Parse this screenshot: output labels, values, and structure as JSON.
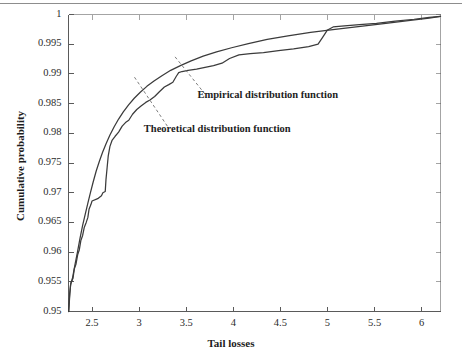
{
  "chart_data": {
    "type": "line",
    "title": "",
    "xlabel": "Tail losses",
    "ylabel": "Cumulative probability",
    "xlim": [
      2.25,
      6.2
    ],
    "ylim": [
      0.95,
      1.0
    ],
    "grid": false,
    "legend_position": "inline-annotations",
    "xticks": [
      "2.5",
      "3",
      "3.5",
      "4",
      "4.5",
      "5",
      "5.5",
      "6"
    ],
    "xtick_values": [
      2.5,
      3,
      3.5,
      4,
      4.5,
      5,
      5.5,
      6
    ],
    "yticks": [
      "0.95",
      "0.955",
      "0.96",
      "0.965",
      "0.97",
      "0.975",
      "0.98",
      "0.985",
      "0.99",
      "0.995",
      "1"
    ],
    "ytick_values": [
      0.95,
      0.955,
      0.96,
      0.965,
      0.97,
      0.975,
      0.98,
      0.985,
      0.99,
      0.995,
      1.0
    ],
    "annotations": [
      {
        "name": "empirical-label",
        "text": "Empirical distribution function",
        "x": 3.62,
        "y": 0.9862
      },
      {
        "name": "theoretical-label",
        "text": "Theoretical distribution function",
        "x": 3.05,
        "y": 0.9805
      }
    ],
    "series": [
      {
        "name": "Theoretical distribution function",
        "color": "#3b3b3b",
        "points": [
          [
            2.252,
            0.95
          ],
          [
            2.262,
            0.9524
          ],
          [
            2.272,
            0.9545
          ],
          [
            2.292,
            0.9556
          ],
          [
            2.318,
            0.9578
          ],
          [
            2.345,
            0.96
          ],
          [
            2.372,
            0.9623
          ],
          [
            2.4,
            0.9645
          ],
          [
            2.428,
            0.9664
          ],
          [
            2.455,
            0.9682
          ],
          [
            2.483,
            0.97
          ],
          [
            2.512,
            0.9718
          ],
          [
            2.545,
            0.9737
          ],
          [
            2.578,
            0.9753
          ],
          [
            2.612,
            0.9768
          ],
          [
            2.65,
            0.9783
          ],
          [
            2.69,
            0.9797
          ],
          [
            2.735,
            0.9811
          ],
          [
            2.782,
            0.9824
          ],
          [
            2.832,
            0.9836
          ],
          [
            2.888,
            0.9848
          ],
          [
            2.948,
            0.9859
          ],
          [
            3.012,
            0.9869
          ],
          [
            3.082,
            0.9879
          ],
          [
            3.158,
            0.9888
          ],
          [
            3.242,
            0.9897
          ],
          [
            3.335,
            0.9906
          ],
          [
            3.438,
            0.9914
          ],
          [
            3.552,
            0.9922
          ],
          [
            3.68,
            0.993
          ],
          [
            3.822,
            0.9937
          ],
          [
            3.982,
            0.9944
          ],
          [
            4.16,
            0.9951
          ],
          [
            4.36,
            0.9958
          ],
          [
            4.58,
            0.9964
          ],
          [
            4.82,
            0.997
          ],
          [
            5.08,
            0.9975
          ],
          [
            5.35,
            0.998
          ],
          [
            5.62,
            0.9985
          ],
          [
            5.88,
            0.999
          ],
          [
            6.08,
            0.9994
          ],
          [
            6.2,
            0.9997
          ]
        ]
      },
      {
        "name": "Empirical distribution function",
        "color": "#3b3b3b",
        "points": [
          [
            2.252,
            0.95
          ],
          [
            2.262,
            0.953
          ],
          [
            2.275,
            0.9548
          ],
          [
            2.298,
            0.9556
          ],
          [
            2.312,
            0.9572
          ],
          [
            2.33,
            0.958
          ],
          [
            2.348,
            0.9596
          ],
          [
            2.365,
            0.9604
          ],
          [
            2.382,
            0.962
          ],
          [
            2.4,
            0.9628
          ],
          [
            2.418,
            0.9642
          ],
          [
            2.438,
            0.965
          ],
          [
            2.455,
            0.9658
          ],
          [
            2.468,
            0.9672
          ],
          [
            2.488,
            0.968
          ],
          [
            2.5,
            0.9686
          ],
          [
            2.56,
            0.969
          ],
          [
            2.6,
            0.9695
          ],
          [
            2.615,
            0.97
          ],
          [
            2.64,
            0.9702
          ],
          [
            2.648,
            0.9722
          ],
          [
            2.66,
            0.9742
          ],
          [
            2.672,
            0.9762
          ],
          [
            2.69,
            0.9778
          ],
          [
            2.712,
            0.9788
          ],
          [
            2.745,
            0.9795
          ],
          [
            2.782,
            0.9802
          ],
          [
            2.82,
            0.9812
          ],
          [
            2.855,
            0.9818
          ],
          [
            2.89,
            0.9822
          ],
          [
            2.93,
            0.9832
          ],
          [
            2.975,
            0.984
          ],
          [
            3.02,
            0.9846
          ],
          [
            3.07,
            0.9852
          ],
          [
            3.115,
            0.9856
          ],
          [
            3.165,
            0.9862
          ],
          [
            3.215,
            0.987
          ],
          [
            3.268,
            0.9878
          ],
          [
            3.315,
            0.9882
          ],
          [
            3.358,
            0.9886
          ],
          [
            3.395,
            0.9896
          ],
          [
            3.42,
            0.9902
          ],
          [
            3.455,
            0.9904
          ],
          [
            3.52,
            0.9906
          ],
          [
            3.61,
            0.9908
          ],
          [
            3.7,
            0.9911
          ],
          [
            3.79,
            0.9914
          ],
          [
            3.88,
            0.9918
          ],
          [
            3.96,
            0.9926
          ],
          [
            4.06,
            0.9932
          ],
          [
            4.18,
            0.9934
          ],
          [
            4.32,
            0.9936
          ],
          [
            4.48,
            0.9939
          ],
          [
            4.64,
            0.9942
          ],
          [
            4.8,
            0.9946
          ],
          [
            4.9,
            0.995
          ],
          [
            4.95,
            0.9962
          ],
          [
            5.0,
            0.9974
          ],
          [
            5.06,
            0.9979
          ],
          [
            5.18,
            0.9981
          ],
          [
            5.34,
            0.9983
          ],
          [
            5.52,
            0.9985
          ],
          [
            5.72,
            0.9989
          ],
          [
            5.92,
            0.9992
          ],
          [
            6.08,
            0.9995
          ],
          [
            6.2,
            0.9997
          ]
        ]
      }
    ],
    "leader_lines": [
      {
        "name": "empirical-leader",
        "from_x": 3.7,
        "from_y": 0.9866,
        "to_x": 3.38,
        "to_y": 0.9929
      },
      {
        "name": "theoretical-leader",
        "from_x": 3.3,
        "from_y": 0.9812,
        "to_x": 2.94,
        "to_y": 0.9897
      }
    ]
  }
}
